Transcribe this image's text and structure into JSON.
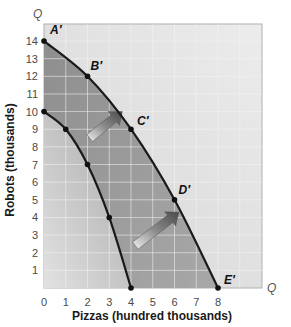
{
  "chart_data": {
    "type": "line",
    "title": "",
    "xlabel": "Pizzas (hundred thousands)",
    "ylabel": "Robots (thousands)",
    "x_axis_end_label": "Q",
    "y_axis_end_label": "Q",
    "xlim": [
      0,
      9
    ],
    "ylim": [
      0,
      15
    ],
    "x_ticks": [
      0,
      1,
      2,
      3,
      4,
      5,
      6,
      7,
      8
    ],
    "y_ticks": [
      1,
      2,
      3,
      4,
      5,
      6,
      7,
      8,
      9,
      10,
      11,
      12,
      13,
      14
    ],
    "grid": true,
    "legend": "none",
    "series": [
      {
        "name": "Original PPF",
        "points": [
          {
            "x": 0,
            "y": 10,
            "label": ""
          },
          {
            "x": 1,
            "y": 9,
            "label": ""
          },
          {
            "x": 2,
            "y": 7,
            "label": ""
          },
          {
            "x": 3,
            "y": 4,
            "label": ""
          },
          {
            "x": 4,
            "y": 0,
            "label": ""
          }
        ]
      },
      {
        "name": "New PPF",
        "points": [
          {
            "x": 0,
            "y": 14,
            "label": "A′"
          },
          {
            "x": 2,
            "y": 12,
            "label": "B′"
          },
          {
            "x": 4,
            "y": 9,
            "label": "C′"
          },
          {
            "x": 6,
            "y": 5,
            "label": "D′"
          },
          {
            "x": 8,
            "y": 0,
            "label": "E′"
          }
        ]
      }
    ],
    "annotations": [
      {
        "type": "arrow",
        "from": {
          "x": 2.1,
          "y": 8.5
        },
        "to": {
          "x": 3.6,
          "y": 10.0
        },
        "meaning": "outward shift of PPF"
      },
      {
        "type": "arrow",
        "from": {
          "x": 4.2,
          "y": 2.4
        },
        "to": {
          "x": 6.2,
          "y": 4.3
        },
        "meaning": "outward shift of PPF"
      }
    ],
    "colors": {
      "plot_background": "#e6e6e6",
      "shaded_region": "#9a9a9a",
      "inner_region": "#b8b8b8",
      "curve": "#1a1a1a",
      "grid": "#f4f4f4",
      "arrow": "#6a6a6a"
    }
  }
}
